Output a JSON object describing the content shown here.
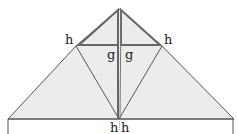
{
  "diagram": {
    "type": "origami-fold-diagram",
    "labels": {
      "top_left": "h",
      "top_right": "h",
      "center_left": "g",
      "center_right": "g",
      "bottom_left": "h",
      "bottom_right": "h"
    },
    "colors": {
      "fill": "#ececec",
      "stroke": "#555555",
      "thick_stroke": "#666666",
      "background": "#ffffff"
    }
  }
}
